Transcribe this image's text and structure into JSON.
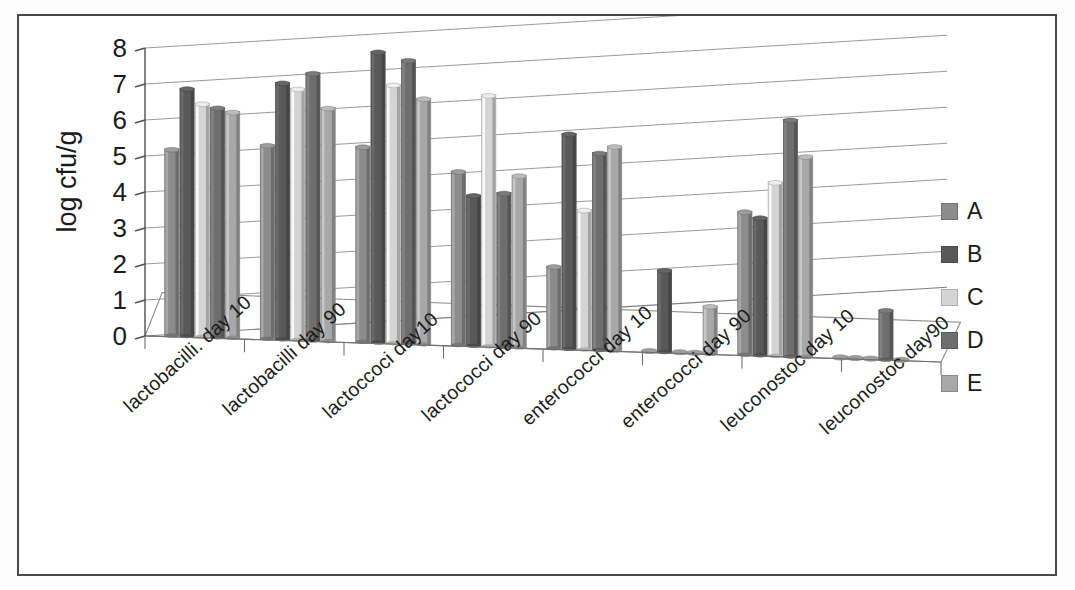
{
  "chart_data": {
    "type": "bar",
    "title": "",
    "xlabel": "",
    "ylabel": "log cfu/g",
    "ylim": [
      0,
      8
    ],
    "yticks": [
      "0",
      "1",
      "2",
      "3",
      "4",
      "5",
      "6",
      "7",
      "8"
    ],
    "grid": true,
    "legend_position": "right",
    "three_d": true,
    "categories": [
      "lactobacilli. day 10",
      "lactobacilli day 90",
      "lactoccoci day10",
      "lactococci day 90",
      "enterococci day 10",
      "enterococci day 90",
      "leuconostoc day 10",
      "leuconostoc day90"
    ],
    "series": [
      {
        "name": "A",
        "color": "#8c8c8c",
        "values": [
          5.2,
          5.4,
          5.45,
          4.85,
          2.3,
          0.0,
          4.0,
          0.0
        ]
      },
      {
        "name": "B",
        "color": "#595959",
        "values": [
          6.9,
          7.15,
          8.1,
          4.2,
          6.0,
          2.3,
          3.85,
          0.0
        ]
      },
      {
        "name": "C",
        "color": "#d4d4d4",
        "values": [
          6.5,
          7.0,
          7.2,
          7.0,
          3.9,
          0.0,
          4.85,
          0.0
        ]
      },
      {
        "name": "D",
        "color": "#6e6e6e",
        "values": [
          6.4,
          7.45,
          7.9,
          4.3,
          5.5,
          0.0,
          6.6,
          1.4
        ]
      },
      {
        "name": "E",
        "color": "#a8a8a8",
        "values": [
          6.3,
          6.5,
          6.85,
          4.8,
          5.7,
          1.35,
          5.6,
          0.0
        ]
      }
    ]
  },
  "legend": {
    "items": [
      {
        "label": "A"
      },
      {
        "label": "B"
      },
      {
        "label": "C"
      },
      {
        "label": "D"
      },
      {
        "label": "E"
      }
    ]
  }
}
